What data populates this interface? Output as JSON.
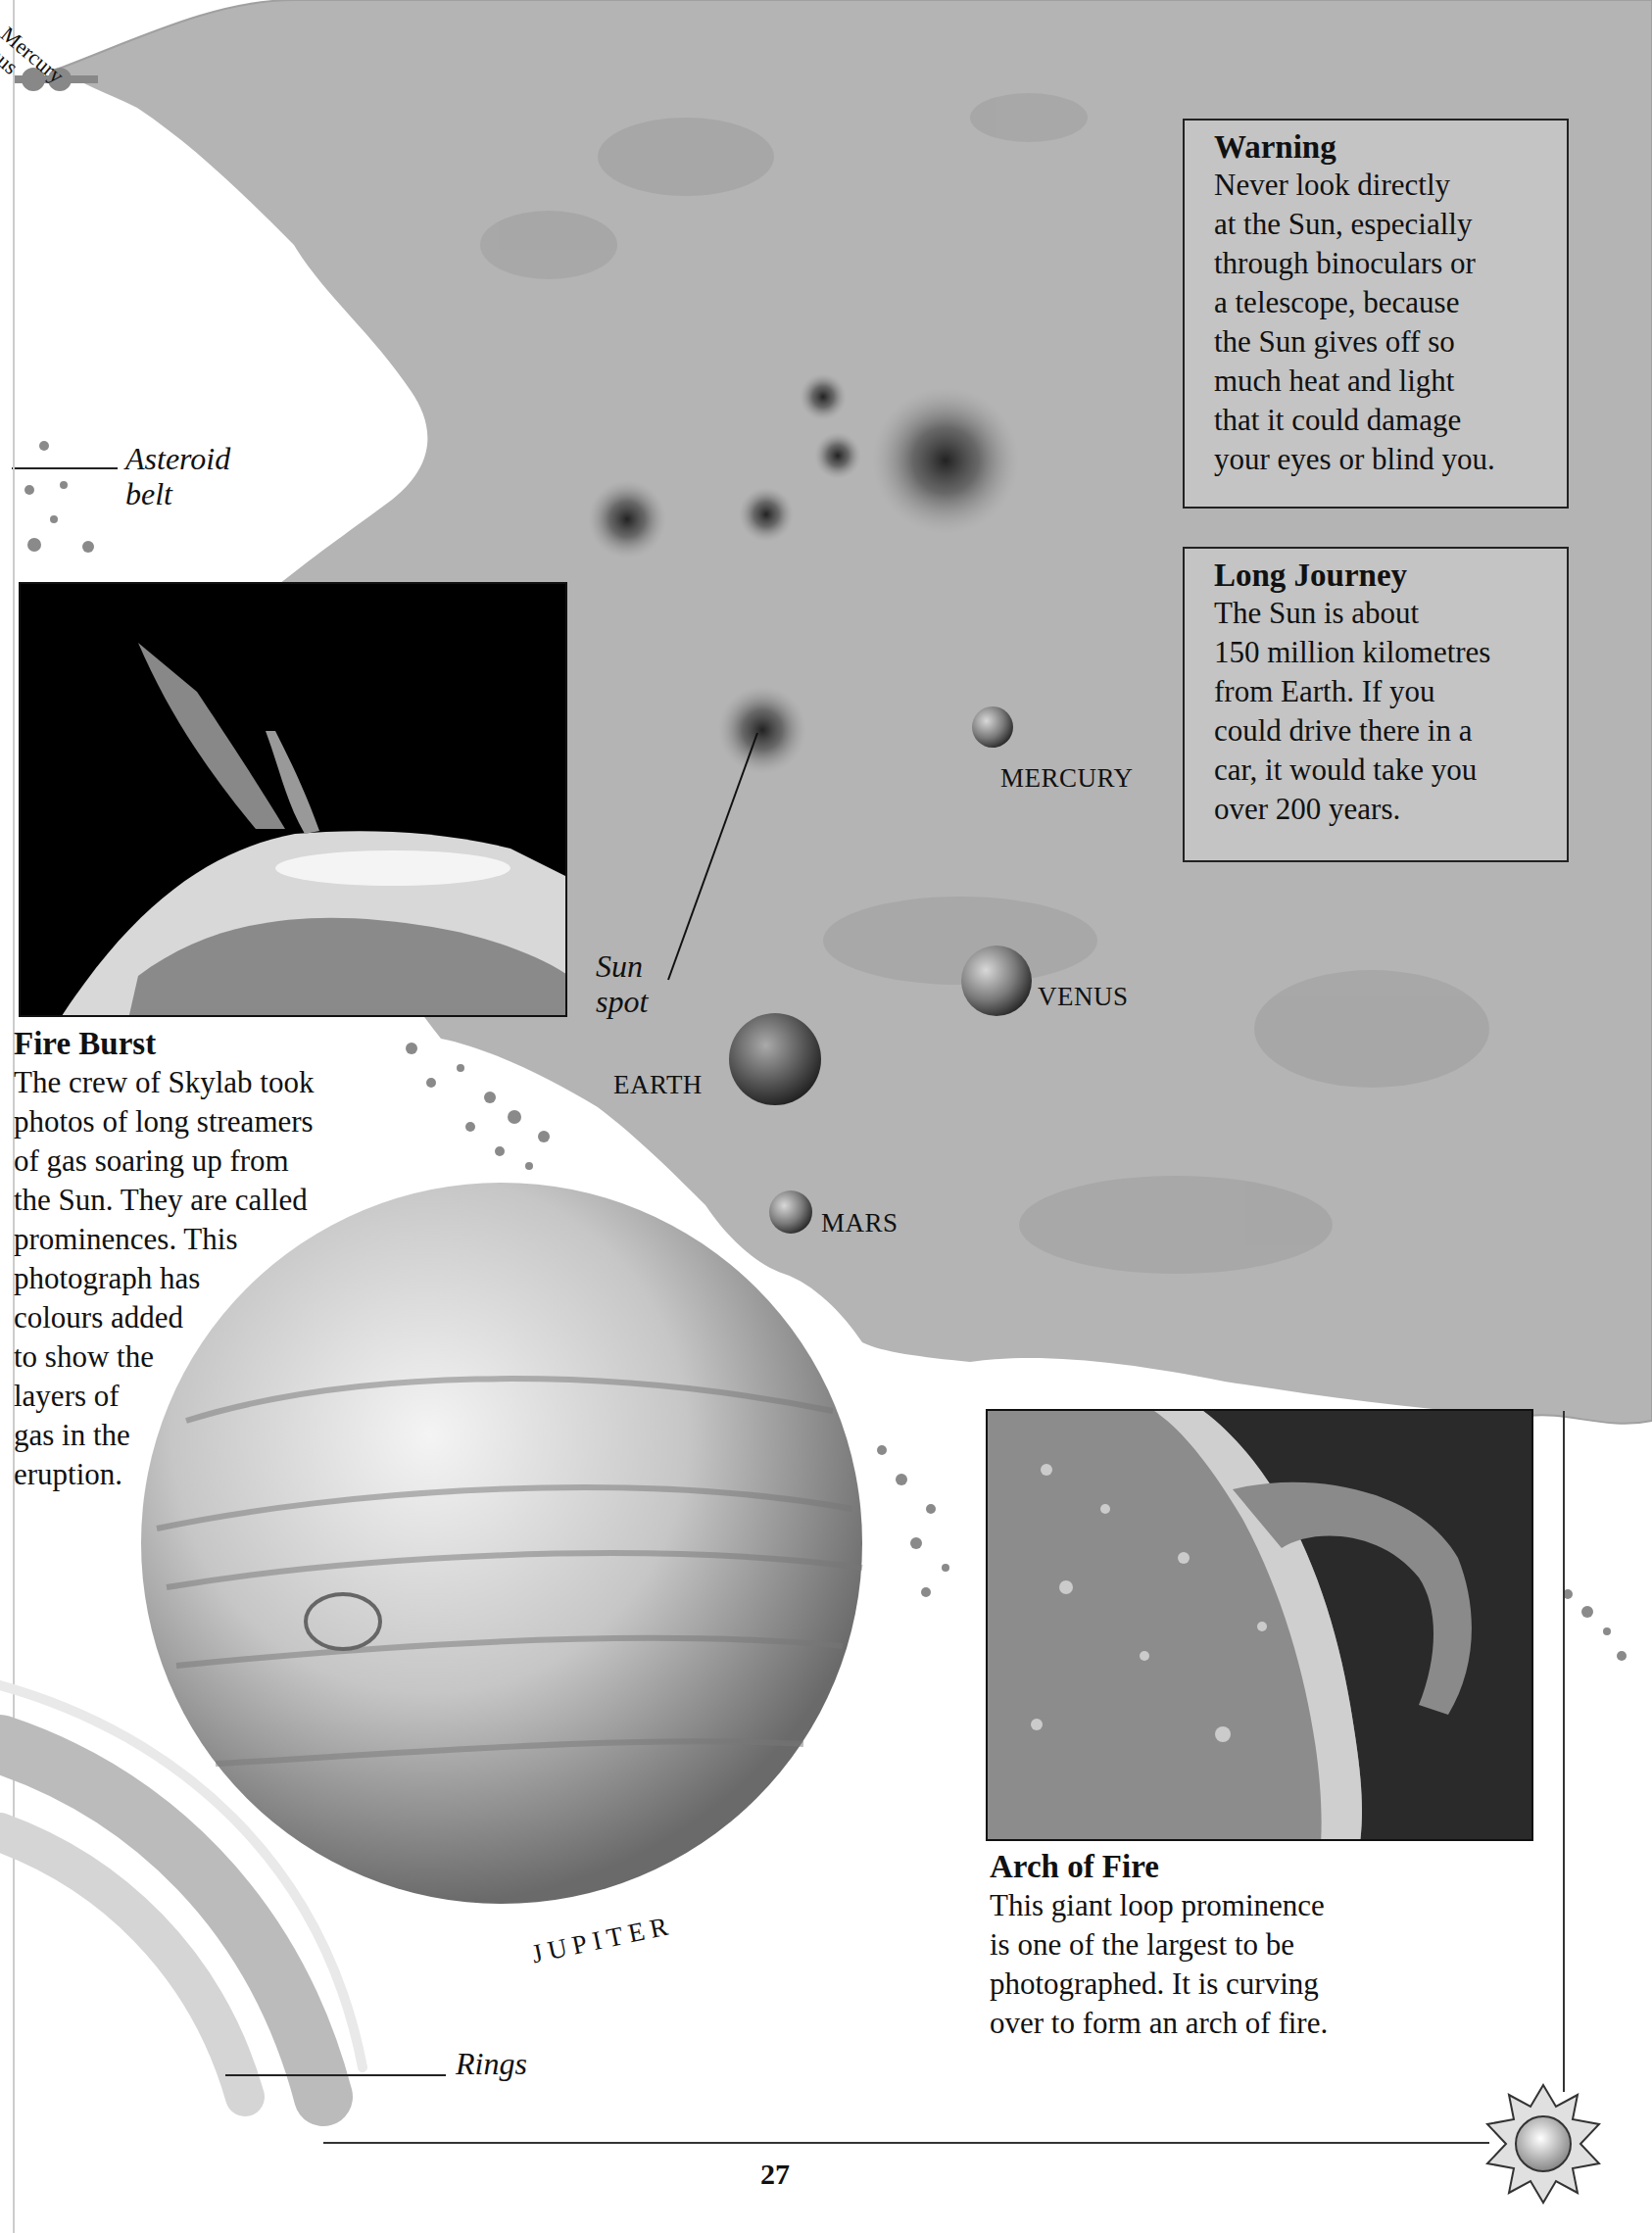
{
  "page": {
    "number": "27",
    "corner_tab": {
      "labels": [
        "Mercury",
        "nus"
      ]
    }
  },
  "boxes": {
    "warning": {
      "title": "Warning",
      "body": "Never look directly\nat the Sun, especially\nthrough binoculars or\na telescope, because\nthe Sun gives off so\nmuch heat and light\nthat it could damage\nyour eyes or blind you."
    },
    "long_journey": {
      "title": "Long Journey",
      "body": "The Sun is about\n150 million kilometres\nfrom Earth. If you\ncould drive there in a\ncar, it would take you\nover 200 years."
    }
  },
  "captions": {
    "fire_burst": {
      "title": "Fire Burst",
      "body": "The crew of Skylab took\nphotos of long streamers\nof gas soaring up from\nthe Sun. They are called\nprominences. This\nphotograph has\ncolours added\nto show the\nlayers of\ngas in the\neruption."
    },
    "arch_of_fire": {
      "title": "Arch of Fire",
      "body": "This giant loop prominence\nis one of the largest to be\nphotographed. It is curving\nover to form an arch of fire."
    }
  },
  "labels": {
    "asteroid_belt": "Asteroid\nbelt",
    "sun_spot": "Sun\nspot",
    "rings": "Rings"
  },
  "planets": {
    "mercury": "MERCURY",
    "venus": "VENUS",
    "earth": "EARTH",
    "mars": "MARS",
    "jupiter": "JUPITER"
  },
  "colors": {
    "sun_surface": "#b4b4b4",
    "box_fill": "#c4c4c4",
    "ink": "#111111"
  }
}
